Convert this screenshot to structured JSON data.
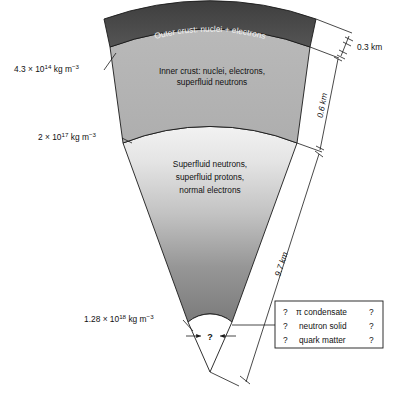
{
  "figure": {
    "type": "cross-section-diagram"
  },
  "layers": [
    {
      "id": "outer-crust",
      "label": "Outer crust: nuclei + electrons",
      "fill": "#4a4a4a",
      "text_color": "#f0f0f0"
    },
    {
      "id": "inner-crust",
      "label_line1": "Inner crust: nuclei, electrons,",
      "label_line2": "superfluid neutrons",
      "fill": "#b4b4b4"
    },
    {
      "id": "core",
      "label_line1": "Superfluid neutrons,",
      "label_line2": "superfluid protons,",
      "label_line3": "normal electrons",
      "fill_top": "#ededed",
      "fill_bottom": "#7d7d7d"
    },
    {
      "id": "inner-core",
      "label": "?",
      "fill": "#ffffff"
    }
  ],
  "density_labels": [
    {
      "id": "density-outer-inner-boundary",
      "mantissa": "4.3 × 10",
      "exponent": "14",
      "units": " kg m",
      "units_exponent": "−3"
    },
    {
      "id": "density-crust-core-boundary",
      "mantissa": "2 × 10",
      "exponent": "17",
      "units": " kg m",
      "units_exponent": "−3"
    },
    {
      "id": "density-inner-core-boundary",
      "mantissa": "1.28 × 10",
      "exponent": "18",
      "units": " kg m",
      "units_exponent": "−3"
    }
  ],
  "dimensions": [
    {
      "id": "outer-crust-thickness",
      "label": "0.3 km"
    },
    {
      "id": "inner-crust-thickness",
      "label": "0.6 km"
    },
    {
      "id": "core-radius",
      "label": "9.7 km"
    }
  ],
  "speculation_box": {
    "rows": [
      {
        "left_mark": "?",
        "label": "π condensate",
        "right_mark": "?"
      },
      {
        "left_mark": "?",
        "label": "neutron solid",
        "right_mark": "?"
      },
      {
        "left_mark": "?",
        "label": "quark matter",
        "right_mark": "?"
      }
    ]
  },
  "core_marker": {
    "label": "?"
  }
}
